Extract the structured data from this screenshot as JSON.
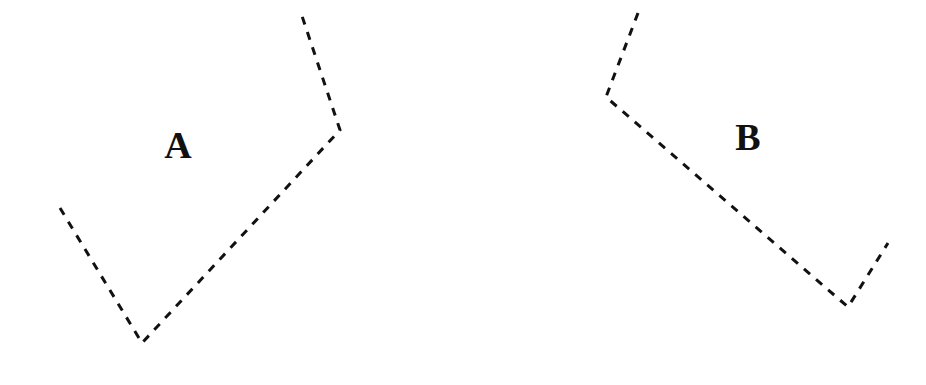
{
  "canvas": {
    "width": 926,
    "height": 385,
    "background_color": "#ffffff"
  },
  "style": {
    "stroke_color": "#111111",
    "stroke_width": 3,
    "dash_length": 8,
    "gap_length": 8,
    "label_color": "#111111",
    "label_font_size": 38
  },
  "labels": [
    {
      "text": "A",
      "x": 178,
      "y": 145
    },
    {
      "text": "B",
      "x": 748,
      "y": 137
    }
  ],
  "chart_data": {
    "type": "line",
    "title": "",
    "subtitle": "",
    "xlabel": "",
    "ylabel": "",
    "xlim": [
      0,
      926
    ],
    "ylim": [
      0,
      385
    ],
    "grid": false,
    "legend": "none",
    "annotations": [
      "A",
      "B"
    ],
    "series": [
      {
        "name": "A",
        "label": "A",
        "label_x": 178,
        "label_y": 145,
        "linestyle": "dashed",
        "color": "#111111",
        "points": [
          [
            60,
            208
          ],
          [
            142,
            343
          ],
          [
            340,
            130
          ],
          [
            320,
            70
          ],
          [
            301,
            13
          ]
        ]
      },
      {
        "name": "B",
        "label": "B",
        "label_x": 748,
        "label_y": 137,
        "linestyle": "dashed",
        "color": "#111111",
        "points": [
          [
            638,
            13
          ],
          [
            606,
            97
          ],
          [
            848,
            307
          ],
          [
            888,
            243
          ]
        ]
      }
    ]
  }
}
